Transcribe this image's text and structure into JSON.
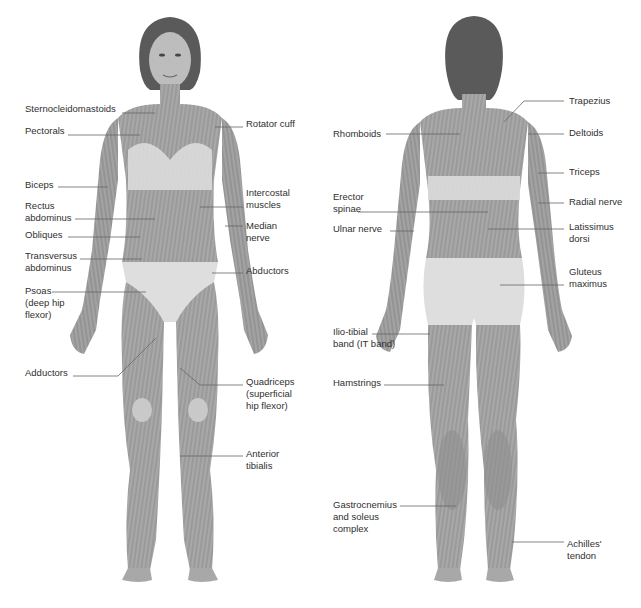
{
  "diagram": {
    "type": "anatomy-muscle-chart",
    "views": [
      "front",
      "back"
    ],
    "colors": {
      "background": "#ffffff",
      "muscle": "#9a9a9a",
      "muscle_dark": "#7d7d7d",
      "fibers": "#e9e9e9",
      "underwear": "#dcdcdc",
      "hair": "#5a5a5a",
      "skin": "#b5b5b5",
      "leader_line": "#666666",
      "text": "#2f2f2f"
    }
  },
  "front": {
    "left_labels": [
      {
        "text": "Sternocleidomastoids",
        "x": 25,
        "y": 103
      },
      {
        "text": "Pectorals",
        "x": 25,
        "y": 125
      },
      {
        "text": "Biceps",
        "x": 25,
        "y": 179
      },
      {
        "text": "Rectus\nabdominus",
        "x": 25,
        "y": 200
      },
      {
        "text": "Obliques",
        "x": 25,
        "y": 229
      },
      {
        "text": "Transversus\nabdominus",
        "x": 25,
        "y": 250
      },
      {
        "text": "Psoas\n(deep hip\nflexor)",
        "x": 25,
        "y": 285
      },
      {
        "text": "Adductors",
        "x": 25,
        "y": 367
      }
    ],
    "right_labels": [
      {
        "text": "Rotator cuff",
        "x": 246,
        "y": 118
      },
      {
        "text": "Intercostal\nmuscles",
        "x": 246,
        "y": 187
      },
      {
        "text": "Median\nnerve",
        "x": 246,
        "y": 220
      },
      {
        "text": "Abductors",
        "x": 246,
        "y": 265
      },
      {
        "text": "Quadriceps\n(superficial\nhip flexor)",
        "x": 246,
        "y": 376
      },
      {
        "text": "Anterior\ntibialis",
        "x": 246,
        "y": 448
      }
    ]
  },
  "back": {
    "left_labels": [
      {
        "text": "Rhomboids",
        "x": 333,
        "y": 128
      },
      {
        "text": "Erector\nspinae",
        "x": 333,
        "y": 191
      },
      {
        "text": "Ulnar nerve",
        "x": 333,
        "y": 223
      },
      {
        "text": "Ilio-tibial\nband (IT band)",
        "x": 333,
        "y": 326
      },
      {
        "text": "Hamstrings",
        "x": 333,
        "y": 377
      },
      {
        "text": "Gastrocnemius\nand soleus\ncomplex",
        "x": 333,
        "y": 499
      }
    ],
    "right_labels": [
      {
        "text": "Trapezius",
        "x": 569,
        "y": 10
      },
      {
        "text": "Deltoids",
        "x": 569,
        "y": 127
      },
      {
        "text": "Triceps",
        "x": 569,
        "y": 166
      },
      {
        "text": "Radial nerve",
        "x": 569,
        "y": 196
      },
      {
        "text": "Latissimus\ndorsi",
        "x": 569,
        "y": 221
      },
      {
        "text": "Gluteus\nmaximus",
        "x": 569,
        "y": 266
      },
      {
        "text": "Achilles'\ntendon",
        "x": 567,
        "y": 538
      }
    ]
  }
}
